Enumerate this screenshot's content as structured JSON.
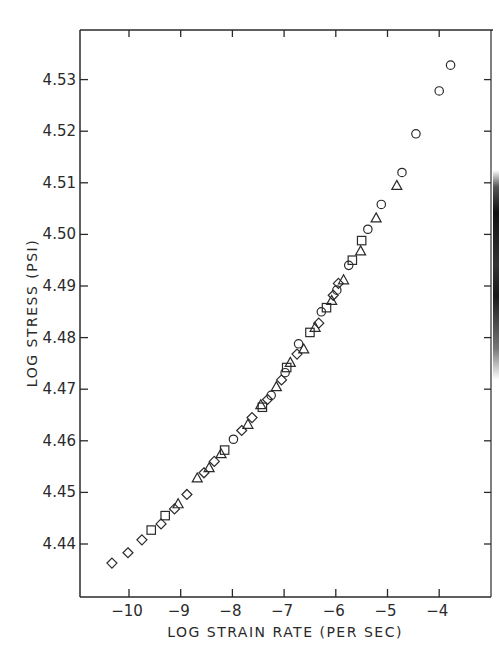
{
  "chart_data": {
    "type": "scatter",
    "title": "",
    "xlabel": "LOG STRAIN RATE (PER SEC)",
    "ylabel": "LOG STRESS (PSI)",
    "xlim": [
      -10.95,
      -3.0
    ],
    "ylim": [
      4.4297,
      4.5397
    ],
    "grid": false,
    "legend": "none",
    "x_ticks": [
      -10,
      -9,
      -8,
      -7,
      -6,
      -5,
      -4
    ],
    "x_tick_labels": [
      "-10",
      "-9",
      "-8",
      "-7",
      "-6",
      "-5",
      "-4"
    ],
    "y_ticks": [
      4.44,
      4.45,
      4.46,
      4.47,
      4.48,
      4.49,
      4.5,
      4.51,
      4.52,
      4.53
    ],
    "y_tick_labels": [
      "4.44",
      "4.45",
      "4.46",
      "4.47",
      "4.48",
      "4.49",
      "4.50",
      "4.51",
      "4.52",
      "4.53"
    ],
    "series": [
      {
        "name": "diamond",
        "marker": "diamond",
        "points": [
          [
            -10.33,
            4.4363
          ],
          [
            -10.02,
            4.4383
          ],
          [
            -9.75,
            4.4408
          ],
          [
            -9.38,
            4.4439
          ],
          [
            -9.12,
            4.4468
          ],
          [
            -8.88,
            4.4496
          ],
          [
            -8.55,
            4.4538
          ],
          [
            -8.35,
            4.456
          ],
          [
            -7.82,
            4.462
          ],
          [
            -7.62,
            4.4645
          ],
          [
            -7.32,
            4.468
          ],
          [
            -7.05,
            4.4718
          ],
          [
            -6.75,
            4.4768
          ],
          [
            -6.33,
            4.4828
          ],
          [
            -6.05,
            4.4882
          ],
          [
            -5.95,
            4.4905
          ]
        ]
      },
      {
        "name": "square",
        "marker": "square",
        "points": [
          [
            -9.57,
            4.4427
          ],
          [
            -9.3,
            4.4455
          ],
          [
            -8.15,
            4.4582
          ],
          [
            -7.42,
            4.4665
          ],
          [
            -6.95,
            4.4742
          ],
          [
            -6.5,
            4.481
          ],
          [
            -6.18,
            4.4858
          ],
          [
            -5.68,
            4.495
          ],
          [
            -5.5,
            4.4988
          ]
        ]
      },
      {
        "name": "triangle",
        "marker": "triangle",
        "points": [
          [
            -9.05,
            4.4478
          ],
          [
            -8.68,
            4.4528
          ],
          [
            -8.45,
            4.4548
          ],
          [
            -8.22,
            4.4575
          ],
          [
            -7.7,
            4.4632
          ],
          [
            -7.45,
            4.467
          ],
          [
            -7.15,
            4.4705
          ],
          [
            -6.88,
            4.4752
          ],
          [
            -6.62,
            4.4778
          ],
          [
            -6.4,
            4.482
          ],
          [
            -6.08,
            4.4872
          ],
          [
            -5.85,
            4.4912
          ],
          [
            -5.52,
            4.4968
          ],
          [
            -5.22,
            4.5032
          ],
          [
            -4.82,
            4.5095
          ]
        ]
      },
      {
        "name": "circle",
        "marker": "circle",
        "points": [
          [
            -7.98,
            4.4603
          ],
          [
            -7.25,
            4.4688
          ],
          [
            -6.98,
            4.4732
          ],
          [
            -6.72,
            4.4788
          ],
          [
            -6.28,
            4.485
          ],
          [
            -5.98,
            4.4892
          ],
          [
            -5.75,
            4.494
          ],
          [
            -5.38,
            4.501
          ],
          [
            -5.12,
            4.5058
          ],
          [
            -4.72,
            4.512
          ],
          [
            -4.45,
            4.5195
          ],
          [
            -4.0,
            4.5278
          ],
          [
            -3.78,
            4.5328
          ]
        ]
      }
    ]
  }
}
